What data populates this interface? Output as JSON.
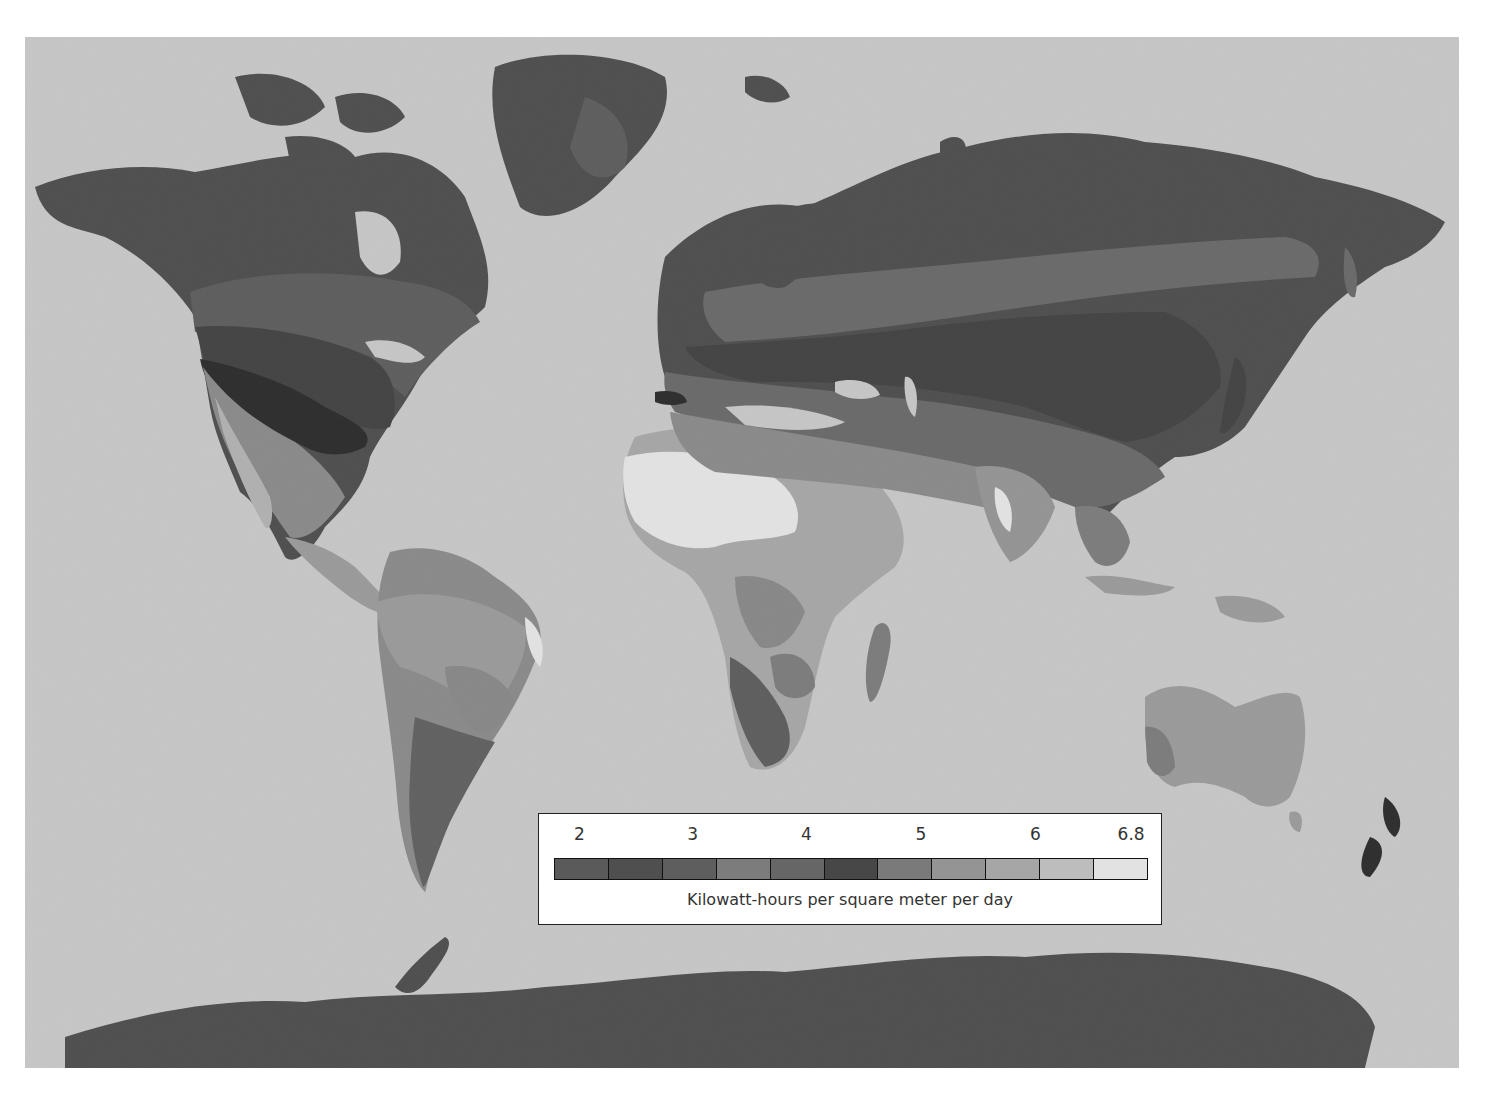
{
  "map": {
    "subject": "Average solar insolation",
    "ocean_color": "#c6c6c6",
    "land_base_color": "#565656"
  },
  "legend": {
    "ticks": [
      {
        "label": "2",
        "pos": 0.065
      },
      {
        "label": "3",
        "pos": 0.247
      },
      {
        "label": "4",
        "pos": 0.43
      },
      {
        "label": "5",
        "pos": 0.614
      },
      {
        "label": "6",
        "pos": 0.798
      },
      {
        "label": "6.8",
        "pos": 0.952
      }
    ],
    "swatches": [
      "#5a5a5a",
      "#4f4f4f",
      "#5e5e5e",
      "#7c7c7c",
      "#666666",
      "#474747",
      "#7a7a7a",
      "#949494",
      "#a6a6a6",
      "#bdbdbd",
      "#e2e2e2"
    ],
    "unit_label": "Kilowatt-hours per square meter per day"
  }
}
